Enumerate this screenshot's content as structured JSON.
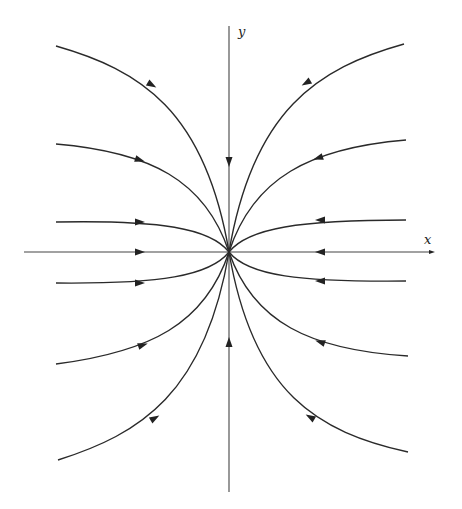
{
  "figure": {
    "type": "phase-portrait",
    "colors": {
      "line": "#2a2a2a",
      "axis": "#444444",
      "background": "#ffffff"
    },
    "origin": [
      229,
      252
    ],
    "axes": {
      "x": {
        "label": "x",
        "from": [
          24,
          252
        ],
        "to": [
          432,
          252
        ],
        "label_pos": [
          424,
          244
        ]
      },
      "y": {
        "label": "y",
        "from": [
          229,
          492
        ],
        "to": [
          229,
          26
        ],
        "label_pos": [
          238,
          36
        ]
      }
    },
    "trajectories": [
      {
        "name": "upper-left-outer",
        "path": "M56,46 C140,70 205,110 229,252",
        "arrow": [
          152,
          85,
          30
        ]
      },
      {
        "name": "upper-left-mid",
        "path": "M56,144 C150,152 205,180 229,252",
        "arrow": [
          140,
          160,
          18
        ]
      },
      {
        "name": "upper-left-inner",
        "path": "M56,222 C160,220 210,228 229,252",
        "arrow": [
          140,
          222,
          0
        ]
      },
      {
        "name": "lower-left-inner",
        "path": "M56,283 C160,284 210,276 229,252",
        "arrow": [
          140,
          283,
          0
        ]
      },
      {
        "name": "lower-left-mid",
        "path": "M56,364 C150,352 205,324 229,252",
        "arrow": [
          143,
          345,
          -18
        ]
      },
      {
        "name": "lower-left-outer",
        "path": "M58,460 C140,434 205,394 229,252",
        "arrow": [
          155,
          418,
          -30
        ]
      },
      {
        "name": "upper-right-outer",
        "path": "M404,44 C318,68 253,110 229,252",
        "arrow": [
          306,
          83,
          150
        ]
      },
      {
        "name": "upper-right-mid",
        "path": "M406,140 C310,148 253,178 229,252",
        "arrow": [
          318,
          158,
          162
        ]
      },
      {
        "name": "upper-right-inner",
        "path": "M406,220 C300,220 248,228 229,252",
        "arrow": [
          320,
          220,
          180
        ]
      },
      {
        "name": "lower-right-inner",
        "path": "M406,281 C300,282 248,276 229,252",
        "arrow": [
          320,
          281,
          180
        ]
      },
      {
        "name": "lower-right-mid",
        "path": "M408,356 C310,350 253,322 229,252",
        "arrow": [
          320,
          342,
          198
        ]
      },
      {
        "name": "lower-right-outer",
        "path": "M408,452 C318,432 253,394 229,252",
        "arrow": [
          310,
          417,
          210
        ]
      }
    ],
    "axis_arrows": [
      {
        "name": "x-neg-arrow",
        "pos": [
          140,
          252
        ],
        "angle": 0
      },
      {
        "name": "x-pos-arrow",
        "pos": [
          320,
          252
        ],
        "angle": 180
      },
      {
        "name": "y-pos-arrow",
        "pos": [
          229,
          162
        ],
        "angle": 90
      },
      {
        "name": "y-neg-arrow",
        "pos": [
          229,
          342
        ],
        "angle": -90
      },
      {
        "name": "x-axis-tip",
        "pos": [
          432,
          252
        ],
        "angle": 0,
        "small": true
      }
    ]
  }
}
